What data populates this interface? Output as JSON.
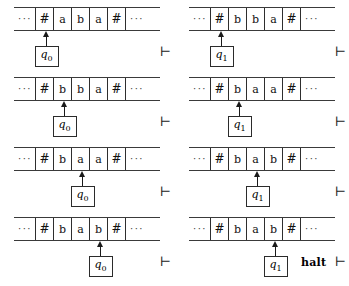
{
  "figure": {
    "kind": "turing-machine-computation-trace",
    "turnstile_symbol": "⊢",
    "halt_label": "halt",
    "ellipsis": "···"
  },
  "configurations": [
    {
      "id": "step-1",
      "row": 0,
      "col": 0,
      "tape": [
        "#",
        "a",
        "b",
        "a",
        "#"
      ],
      "head_index": 1,
      "state": "q",
      "state_subscript": "0",
      "turnstile": "⊢"
    },
    {
      "id": "step-2",
      "row": 0,
      "col": 1,
      "tape": [
        "#",
        "b",
        "b",
        "a",
        "#"
      ],
      "head_index": 1,
      "state": "q",
      "state_subscript": "1",
      "turnstile": "⊢"
    },
    {
      "id": "step-3",
      "row": 1,
      "col": 0,
      "tape": [
        "#",
        "b",
        "b",
        "a",
        "#"
      ],
      "head_index": 2,
      "state": "q",
      "state_subscript": "0",
      "turnstile": "⊢"
    },
    {
      "id": "step-4",
      "row": 1,
      "col": 1,
      "tape": [
        "#",
        "b",
        "a",
        "a",
        "#"
      ],
      "head_index": 2,
      "state": "q",
      "state_subscript": "1",
      "turnstile": "⊢"
    },
    {
      "id": "step-5",
      "row": 2,
      "col": 0,
      "tape": [
        "#",
        "b",
        "a",
        "a",
        "#"
      ],
      "head_index": 3,
      "state": "q",
      "state_subscript": "0",
      "turnstile": "⊢"
    },
    {
      "id": "step-6",
      "row": 2,
      "col": 1,
      "tape": [
        "#",
        "b",
        "a",
        "b",
        "#"
      ],
      "head_index": 3,
      "state": "q",
      "state_subscript": "1",
      "turnstile": "⊢"
    },
    {
      "id": "step-7",
      "row": 3,
      "col": 0,
      "tape": [
        "#",
        "b",
        "a",
        "b",
        "#"
      ],
      "head_index": 4,
      "state": "q",
      "state_subscript": "0",
      "turnstile": "⊢"
    },
    {
      "id": "step-8",
      "row": 3,
      "col": 1,
      "tape": [
        "#",
        "b",
        "a",
        "b",
        "#"
      ],
      "head_index": 4,
      "state": "q",
      "state_subscript": "1",
      "turnstile": "⊢",
      "halt": "halt"
    }
  ]
}
